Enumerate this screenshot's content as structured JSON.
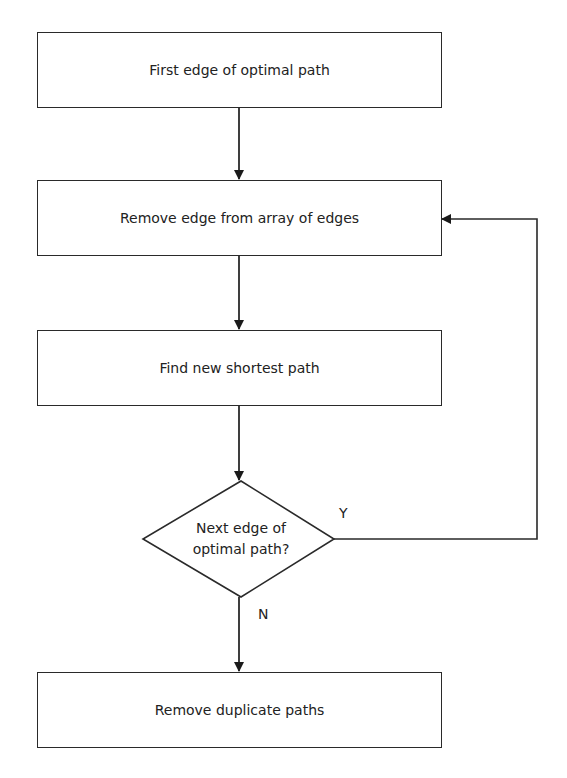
{
  "diagram": {
    "type": "flowchart",
    "nodes": [
      {
        "id": "n1",
        "shape": "rectangle",
        "label": "First edge of optimal path"
      },
      {
        "id": "n2",
        "shape": "rectangle",
        "label": "Remove edge from array of edges"
      },
      {
        "id": "n3",
        "shape": "rectangle",
        "label": "Find new shortest path"
      },
      {
        "id": "n4",
        "shape": "diamond",
        "label_line1": "Next edge of",
        "label_line2": "optimal path?"
      },
      {
        "id": "n5",
        "shape": "rectangle",
        "label": "Remove duplicate paths"
      }
    ],
    "edges": [
      {
        "from": "n1",
        "to": "n2",
        "label": ""
      },
      {
        "from": "n2",
        "to": "n3",
        "label": ""
      },
      {
        "from": "n3",
        "to": "n4",
        "label": ""
      },
      {
        "from": "n4",
        "to": "n2",
        "label": "Y"
      },
      {
        "from": "n4",
        "to": "n5",
        "label": "N"
      }
    ],
    "branch_yes": "Y",
    "branch_no": "N",
    "line_color": "#2a2a2a"
  }
}
